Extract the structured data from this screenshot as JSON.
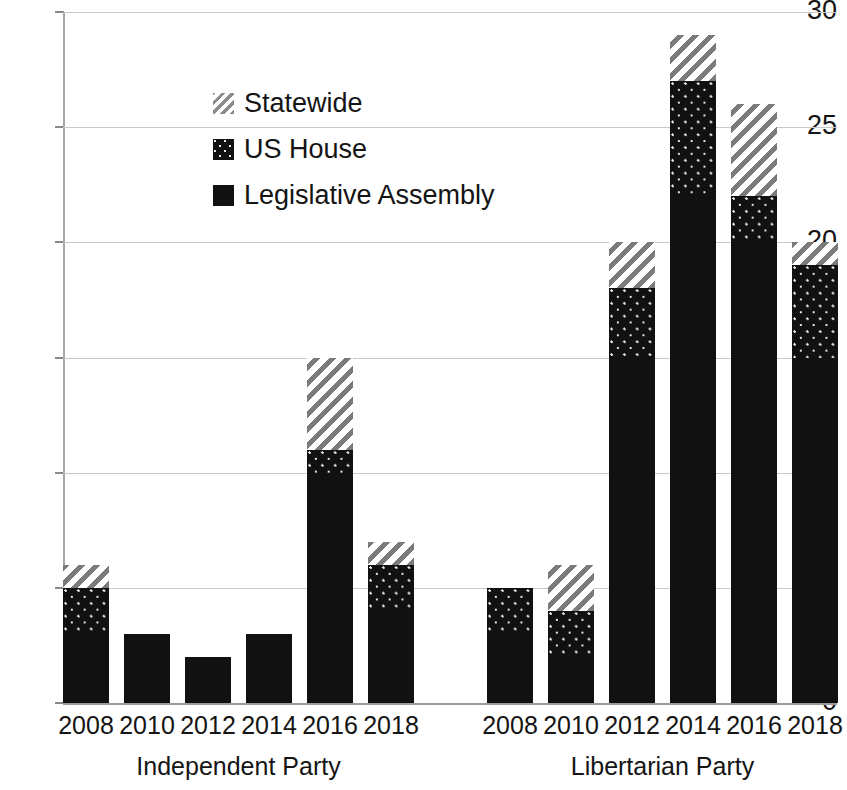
{
  "chart_data": {
    "type": "bar",
    "subtype": "stacked-bar-grouped",
    "title": "",
    "xlabel": "",
    "ylabel": "",
    "ylim": [
      0,
      30
    ],
    "y_ticks": [
      0,
      5,
      10,
      15,
      20,
      25,
      30
    ],
    "y_tick_labels": [
      "0",
      "5",
      "10",
      "15",
      "20",
      "25",
      "30"
    ],
    "grid": true,
    "grid_axis": "y",
    "legend_position": "upper-left-inside",
    "categories": [
      "2008",
      "2010",
      "2012",
      "2014",
      "2016",
      "2018"
    ],
    "groups": [
      {
        "name": "Independent Party",
        "series": [
          {
            "name": "Legislative Assembly",
            "values": [
              3,
              3,
              2,
              3,
              10,
              4
            ]
          },
          {
            "name": "US House",
            "values": [
              2,
              0,
              0,
              0,
              1,
              2
            ]
          },
          {
            "name": "Statewide",
            "values": [
              1,
              0,
              0,
              0,
              4,
              1
            ]
          }
        ],
        "totals": [
          6,
          3,
          2,
          3,
          15,
          7
        ]
      },
      {
        "name": "Libertarian Party",
        "series": [
          {
            "name": "Legislative Assembly",
            "values": [
              3,
              2,
              15,
              22,
              20,
              15
            ]
          },
          {
            "name": "US House",
            "values": [
              2,
              2,
              3,
              5,
              2,
              4
            ]
          },
          {
            "name": "Statewide",
            "values": [
              0,
              2,
              2,
              2,
              4,
              1
            ]
          }
        ],
        "totals": [
          5,
          6,
          20,
          29,
          26,
          20
        ]
      }
    ],
    "series_styles": [
      {
        "name": "Legislative Assembly",
        "fill": "solid",
        "color": "#111111"
      },
      {
        "name": "US House",
        "fill": "dotted",
        "color": "#111111"
      },
      {
        "name": "Statewide",
        "fill": "hatched",
        "color": "#7b7b7b"
      }
    ]
  },
  "legend": {
    "items": [
      {
        "label": "Statewide",
        "fill": "hatched"
      },
      {
        "label": "US House",
        "fill": "dotted"
      },
      {
        "label": "Legislative Assembly",
        "fill": "solid"
      }
    ]
  },
  "axis": {
    "y_labels": [
      "30",
      "25",
      "20",
      "15",
      "10",
      "5",
      "0"
    ],
    "x_labels_group1": [
      "2008",
      "2010",
      "2012",
      "2014",
      "2016",
      "2018"
    ],
    "x_labels_group2": [
      "2008",
      "2010",
      "2012",
      "2014",
      "2016",
      "2018"
    ]
  },
  "group_labels": {
    "left": "Independent Party",
    "right": "Libertarian Party"
  },
  "colors": {
    "bar_solid": "#111111",
    "hatch_stroke": "#7b7b7b",
    "gridline": "#c9c9c9",
    "axis": "#9a9a9a",
    "text": "#151515",
    "background": "#ffffff"
  }
}
